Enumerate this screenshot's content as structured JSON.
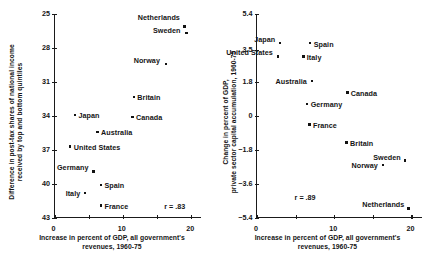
{
  "figure": {
    "width": 435,
    "height": 269,
    "background": "#ffffff",
    "ink": "#121212"
  },
  "chart_data": [
    {
      "id": "left",
      "type": "scatter",
      "title": "",
      "xlabel": "Increase in percent of GDP, all government's revenues, 1960-75",
      "xlabel_line1": "Increase in percent of GDP, all government's",
      "xlabel_line2": "revenues, 1960-75",
      "ylabel": "Difference in post-tax shares of national income received by top and bottom quintiles",
      "ylabel_line1": "Difference in post-tax shares of national income",
      "ylabel_line2": "received by top and bottom quintiles",
      "xlim": [
        0,
        21.5
      ],
      "ylim": [
        25,
        43
      ],
      "y_inverted": true,
      "xticks": [
        0,
        5,
        10,
        15,
        20
      ],
      "xtick_labels": [
        "0",
        "",
        "10",
        "",
        "20"
      ],
      "yticks": [
        25,
        28,
        31,
        34,
        37,
        40,
        43
      ],
      "ytick_labels": [
        "25",
        "28",
        "31",
        "34",
        "37",
        "40",
        "43"
      ],
      "grid": false,
      "legend": false,
      "annotation": "r = .83",
      "annotation_x": 16.2,
      "annotation_y": 42.0,
      "points": [
        {
          "name": "Netherlands",
          "x": 19.0,
          "y": 26.1,
          "label_side": "left",
          "label_dx": -3.5,
          "label_dy": -8.5
        },
        {
          "name": "Sweden",
          "x": 19.3,
          "y": 26.7,
          "label_side": "left",
          "label_dx": -5.0,
          "label_dy": -3.0
        },
        {
          "name": "Norway",
          "x": 16.3,
          "y": 29.4,
          "label_side": "left",
          "label_dx": -5.0,
          "label_dy": -3.0
        },
        {
          "name": "Britain",
          "x": 11.6,
          "y": 32.3,
          "label_side": "right",
          "label_dx": 4.5,
          "label_dy": 1.0
        },
        {
          "name": "Japan",
          "x": 3.0,
          "y": 33.9,
          "label_side": "right",
          "label_dx": 4.5,
          "label_dy": 1.0
        },
        {
          "name": "Canada",
          "x": 11.4,
          "y": 34.1,
          "label_side": "right",
          "label_dx": 4.5,
          "label_dy": 1.0
        },
        {
          "name": "Australia",
          "x": 6.3,
          "y": 35.4,
          "label_side": "right",
          "label_dx": 4.5,
          "label_dy": 1.0
        },
        {
          "name": "United States",
          "x": 2.3,
          "y": 36.7,
          "label_side": "right",
          "label_dx": 4.5,
          "label_dy": 1.0
        },
        {
          "name": "Germany",
          "x": 5.7,
          "y": 38.9,
          "label_side": "left",
          "label_dx": -4.0,
          "label_dy": -3.5
        },
        {
          "name": "Spain",
          "x": 6.8,
          "y": 40.1,
          "label_side": "right",
          "label_dx": 4.5,
          "label_dy": 1.0
        },
        {
          "name": "Italy",
          "x": 4.5,
          "y": 40.8,
          "label_side": "left",
          "label_dx": -4.0,
          "label_dy": 1.0
        },
        {
          "name": "France",
          "x": 6.8,
          "y": 41.9,
          "label_side": "right",
          "label_dx": 4.5,
          "label_dy": 1.0
        }
      ]
    },
    {
      "id": "right",
      "type": "scatter",
      "title": "",
      "xlabel": "Increase in percent of GDP, all government's revenues, 1960-75",
      "xlabel_line1": "Increase in percent of GDP, all government's",
      "xlabel_line2": "revenues, 1960-75",
      "ylabel": "Change in percent of GDP, private sector capital accumulation, 1960-75",
      "ylabel_line1": "Change in percent of GDP,",
      "ylabel_line2": "private sector capital accumulation, 1960-75",
      "xlim": [
        0,
        21.5
      ],
      "ylim": [
        -5.4,
        5.4
      ],
      "y_inverted": false,
      "xticks": [
        0,
        5,
        10,
        15,
        20
      ],
      "xtick_labels": [
        "0",
        "",
        "10",
        "",
        "20"
      ],
      "yticks": [
        5.4,
        3.5,
        1.8,
        0,
        -1.8,
        -3.6,
        -5.4
      ],
      "ytick_labels": [
        "5.4",
        "3.5",
        "1.8",
        "0",
        "−1.8",
        "−3.6",
        "−5.4"
      ],
      "grid": false,
      "legend": false,
      "annotation": "r = .89",
      "annotation_x": 5.0,
      "annotation_y": -4.35,
      "points": [
        {
          "name": "Japan",
          "x": 3.0,
          "y": 3.85,
          "label_side": "left",
          "label_dx": -4.0,
          "label_dy": -3.5
        },
        {
          "name": "Spain",
          "x": 6.9,
          "y": 3.85,
          "label_side": "right",
          "label_dx": 4.5,
          "label_dy": 1.0
        },
        {
          "name": "Italy",
          "x": 6.0,
          "y": 3.15,
          "label_side": "right",
          "label_dx": 4.5,
          "label_dy": 1.0
        },
        {
          "name": "United States",
          "x": 2.7,
          "y": 3.15,
          "label_side": "left",
          "label_dx": -4.0,
          "label_dy": -3.5
        },
        {
          "name": "Australia",
          "x": 7.1,
          "y": 1.85,
          "label_side": "left",
          "label_dx": -4.0,
          "label_dy": 1.0
        },
        {
          "name": "Canada",
          "x": 11.7,
          "y": 1.25,
          "label_side": "right",
          "label_dx": 4.5,
          "label_dy": 1.0
        },
        {
          "name": "Germany",
          "x": 6.5,
          "y": 0.65,
          "label_side": "right",
          "label_dx": 4.5,
          "label_dy": 1.0
        },
        {
          "name": "France",
          "x": 6.8,
          "y": -0.45,
          "label_side": "right",
          "label_dx": 4.5,
          "label_dy": 1.0
        },
        {
          "name": "Britain",
          "x": 11.6,
          "y": -1.4,
          "label_side": "right",
          "label_dx": 4.5,
          "label_dy": 1.0
        },
        {
          "name": "Norway",
          "x": 16.3,
          "y": -2.6,
          "label_side": "left",
          "label_dx": -4.0,
          "label_dy": 1.0
        },
        {
          "name": "Sweden",
          "x": 19.2,
          "y": -2.35,
          "label_side": "left",
          "label_dx": -3.5,
          "label_dy": -3.0
        },
        {
          "name": "Netherlands",
          "x": 19.6,
          "y": -4.9,
          "label_side": "left",
          "label_dx": -3.0,
          "label_dy": -3.5
        }
      ]
    }
  ]
}
